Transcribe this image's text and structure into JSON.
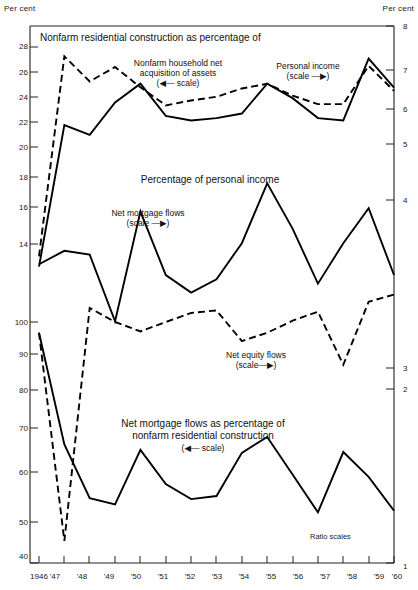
{
  "figure": {
    "left_axis_title": "Per cent",
    "right_axis_title": "Per cent",
    "ratio_note": "Ratio scales",
    "panel_titles": {
      "top": "Nonfarm residential construction as percentage of",
      "middle": "Percentage of personal income",
      "bottom_line1": "Net mortgage flows as percentage of",
      "bottom_line2": "nonfarm residential construction",
      "bottom_scale": "(◀— scale)"
    },
    "series_labels": {
      "household_assets_l1": "Nonfarm household net",
      "household_assets_l2": "acquisition of assets",
      "household_assets_scale": "(◀— scale)",
      "personal_income": "Personal income",
      "personal_income_scale": "(scale —▶)",
      "net_mortgage_flows": "Net mortgage flows",
      "net_mortgage_flows_scale": "(scale —▶)",
      "net_equity_flows": "Net equity flows",
      "net_equity_flows_scale": "(scale—▶)"
    }
  },
  "chart_data": {
    "type": "line",
    "title": "Nonfarm residential construction as percentage of",
    "xlabel": "",
    "ylabel": "Per cent",
    "grid": false,
    "legend_position": "inline-annotations",
    "scales": {
      "left": {
        "note": "Ratio (log) scale, two stacked segments",
        "upper_ticks": [
          14,
          16,
          18,
          20,
          22,
          24,
          26,
          28
        ],
        "lower_ticks": [
          40,
          50,
          60,
          70,
          80,
          90,
          100
        ],
        "units": "Per cent"
      },
      "right": {
        "note": "Ratio (log) scale",
        "ticks": [
          1,
          2,
          3,
          4,
          5,
          6,
          7,
          8
        ],
        "units": "Per cent"
      }
    },
    "x": [
      "1946",
      "'47",
      "'48",
      "'49",
      "'50",
      "'51",
      "'52",
      "'53",
      "'54",
      "'55",
      "'56",
      "'57",
      "'58",
      "'59",
      "'60"
    ],
    "series": [
      {
        "name": "Nonfarm household net acquisition of assets",
        "style": "dashed",
        "axis": "left-upper",
        "values": [
          13.4,
          27.1,
          24.8,
          26.1,
          24.3,
          22.8,
          23.2,
          23.5,
          24.2,
          24.6,
          23.6,
          22.9,
          22.9,
          26.2,
          24.0
        ]
      },
      {
        "name": "Personal income",
        "style": "solid",
        "axis": "right",
        "values": [
          3.15,
          5.45,
          5.25,
          5.95,
          6.4,
          5.65,
          5.55,
          5.6,
          5.7,
          6.4,
          6.05,
          5.6,
          5.55,
          7.05,
          6.3
        ]
      },
      {
        "name": "Net mortgage flows",
        "style": "solid",
        "axis": "right",
        "values": [
          3.18,
          3.35,
          3.3,
          2.55,
          3.9,
          3.05,
          2.85,
          3.0,
          3.45,
          4.35,
          3.65,
          2.95,
          3.45,
          3.95,
          3.05
        ]
      },
      {
        "name": "Net equity flows",
        "style": "dashed",
        "axis": "left-lower",
        "values": [
          96.0,
          43.5,
          105.5,
          100.0,
          96.5,
          100.0,
          103.5,
          104.5,
          93.0,
          96.0,
          100.5,
          104.0,
          85.0,
          108.0,
          111.0
        ]
      },
      {
        "name": "Net mortgage flows as percentage of nonfarm residential construction",
        "style": "solid",
        "axis": "left-lower",
        "values": [
          96.0,
          62.8,
          51.2,
          50.0,
          61.5,
          54.0,
          51.0,
          51.6,
          60.8,
          64.6,
          56.0,
          48.5,
          61.0,
          55.5,
          48.8
        ]
      }
    ]
  },
  "left_axis_labels": [
    "28",
    "26",
    "24",
    "22",
    "20",
    "18",
    "16",
    "14",
    "100",
    "90",
    "80",
    "70",
    "60",
    "50",
    "40"
  ],
  "right_axis_labels": [
    "8",
    "7",
    "6",
    "5",
    "4",
    "3",
    "2",
    "1"
  ],
  "x_axis_labels": [
    "1946",
    "'47",
    "'48",
    "'49",
    "'50",
    "'51",
    "'52",
    "'53",
    "'54",
    "'55",
    "'56",
    "'57",
    "'58",
    "'59",
    "'60"
  ]
}
